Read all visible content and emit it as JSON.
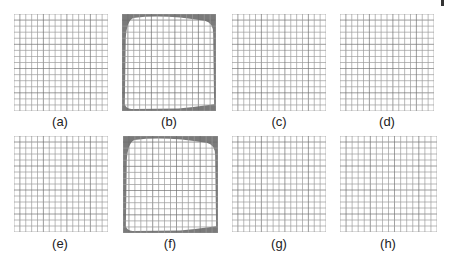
{
  "figure": {
    "panels": [
      {
        "id": "a",
        "label": "(a)",
        "distorted": false,
        "x": 14,
        "y": 14,
        "w": 94,
        "h": 97,
        "label_x": 60,
        "label_y": 115
      },
      {
        "id": "b",
        "label": "(b)",
        "distorted": true,
        "x": 122,
        "y": 14,
        "w": 94,
        "h": 97,
        "label_x": 169,
        "label_y": 115
      },
      {
        "id": "c",
        "label": "(c)",
        "distorted": false,
        "x": 232,
        "y": 14,
        "w": 94,
        "h": 97,
        "label_x": 279,
        "label_y": 115
      },
      {
        "id": "d",
        "label": "(d)",
        "distorted": false,
        "x": 340,
        "y": 14,
        "w": 94,
        "h": 97,
        "label_x": 387,
        "label_y": 115
      },
      {
        "id": "e",
        "label": "(e)",
        "distorted": false,
        "x": 14,
        "y": 136,
        "w": 94,
        "h": 96,
        "label_x": 60,
        "label_y": 237
      },
      {
        "id": "f",
        "label": "(f)",
        "distorted": true,
        "x": 123,
        "y": 136,
        "w": 95,
        "h": 97,
        "label_x": 170,
        "label_y": 237
      },
      {
        "id": "g",
        "label": "(g)",
        "distorted": false,
        "x": 232,
        "y": 136,
        "w": 94,
        "h": 96,
        "label_x": 279,
        "label_y": 237
      },
      {
        "id": "h",
        "label": "(h)",
        "distorted": false,
        "x": 340,
        "y": 136,
        "w": 97,
        "h": 96,
        "label_x": 388,
        "label_y": 237
      }
    ],
    "grid_cells": 16,
    "colors": {
      "grid_line": "#9a9a9a",
      "grid_line_dark": "#6e6e6e",
      "border_fill": "#7a7a7a",
      "label_text": "#222222"
    }
  }
}
